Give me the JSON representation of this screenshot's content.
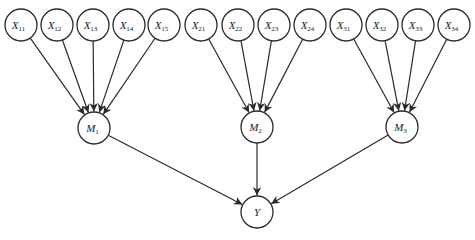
{
  "diagram": {
    "type": "hierarchical directed graph",
    "node_radius": 16,
    "nodes": [
      {
        "id": "X11",
        "base": "X",
        "sub": "11",
        "x": 21,
        "y": 25
      },
      {
        "id": "X12",
        "base": "X",
        "sub": "12",
        "x": 57,
        "y": 25
      },
      {
        "id": "X13",
        "base": "X",
        "sub": "13",
        "x": 93,
        "y": 25
      },
      {
        "id": "X14",
        "base": "X",
        "sub": "14",
        "x": 129,
        "y": 25
      },
      {
        "id": "X15",
        "base": "X",
        "sub": "15",
        "x": 164,
        "y": 25
      },
      {
        "id": "X21",
        "base": "X",
        "sub": "21",
        "x": 201,
        "y": 25
      },
      {
        "id": "X22",
        "base": "X",
        "sub": "22",
        "x": 238,
        "y": 25
      },
      {
        "id": "X23",
        "base": "X",
        "sub": "23",
        "x": 274,
        "y": 25
      },
      {
        "id": "X24",
        "base": "X",
        "sub": "24",
        "x": 310,
        "y": 25
      },
      {
        "id": "X31",
        "base": "X",
        "sub": "31",
        "x": 346,
        "y": 25
      },
      {
        "id": "X32",
        "base": "X",
        "sub": "32",
        "x": 382,
        "y": 25
      },
      {
        "id": "X33",
        "base": "X",
        "sub": "33",
        "x": 418,
        "y": 25
      },
      {
        "id": "X34",
        "base": "X",
        "sub": "34",
        "x": 454,
        "y": 25
      },
      {
        "id": "M1",
        "base": "M",
        "sub": "1",
        "x": 94,
        "y": 128
      },
      {
        "id": "M2",
        "base": "M",
        "sub": "2",
        "x": 257,
        "y": 127
      },
      {
        "id": "M3",
        "base": "M",
        "sub": "3",
        "x": 402,
        "y": 127
      },
      {
        "id": "Y",
        "base": "Y",
        "sub": "",
        "x": 257,
        "y": 212
      }
    ],
    "edges": [
      [
        "X11",
        "M1"
      ],
      [
        "X12",
        "M1"
      ],
      [
        "X13",
        "M1"
      ],
      [
        "X14",
        "M1"
      ],
      [
        "X15",
        "M1"
      ],
      [
        "X21",
        "M2"
      ],
      [
        "X22",
        "M2"
      ],
      [
        "X23",
        "M2"
      ],
      [
        "X24",
        "M2"
      ],
      [
        "X31",
        "M3"
      ],
      [
        "X32",
        "M3"
      ],
      [
        "X33",
        "M3"
      ],
      [
        "X34",
        "M3"
      ],
      [
        "M1",
        "Y"
      ],
      [
        "M2",
        "Y"
      ],
      [
        "M3",
        "Y"
      ]
    ],
    "colors": {
      "stroke": "#2a2a2a",
      "fill": "#ffffff",
      "text": "#222222"
    }
  }
}
